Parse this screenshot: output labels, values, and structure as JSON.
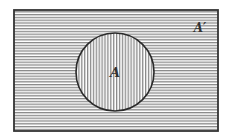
{
  "diagram": {
    "type": "venn",
    "universe": {
      "label": "A′",
      "shading": "horizontal-lines"
    },
    "sets": [
      {
        "label": "A",
        "shading": "vertical-lines"
      }
    ],
    "colors": {
      "stroke": "#333333",
      "hatch": "#8a8a8a",
      "background": "#ffffff"
    }
  }
}
